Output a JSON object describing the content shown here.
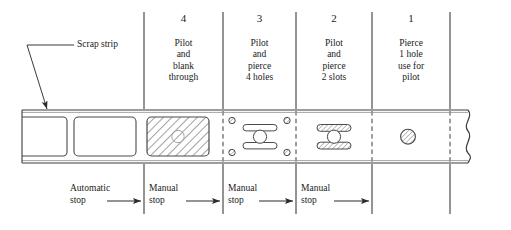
{
  "figure": {
    "annotation": {
      "scrap_strip_label": "Scrap strip"
    },
    "colors": {
      "line": "#3c3c3c",
      "hatch": "#6b6b6b",
      "background": "#ffffff",
      "text": "#1a1a1a"
    },
    "stations": [
      {
        "number": "4",
        "operation": "Pilot\nand\nblank\nthrough",
        "stop": "Manual\nstop",
        "feature": "hatched-blank"
      },
      {
        "number": "3",
        "operation": "Pilot\nand\npierce\n4 holes",
        "stop": "Manual\nstop",
        "feature": "four-holes-two-slots-pilot"
      },
      {
        "number": "2",
        "operation": "Pilot\nand\npierce\n2 slots",
        "stop": "Manual\nstop",
        "feature": "two-hatched-slots-pilot"
      },
      {
        "number": "1",
        "operation": "Pierce\n1 hole\nuse for\npilot",
        "stop": "",
        "feature": "single-hatched-pilot-hole"
      }
    ],
    "first_stop": {
      "label": "Automatic\nstop"
    }
  }
}
